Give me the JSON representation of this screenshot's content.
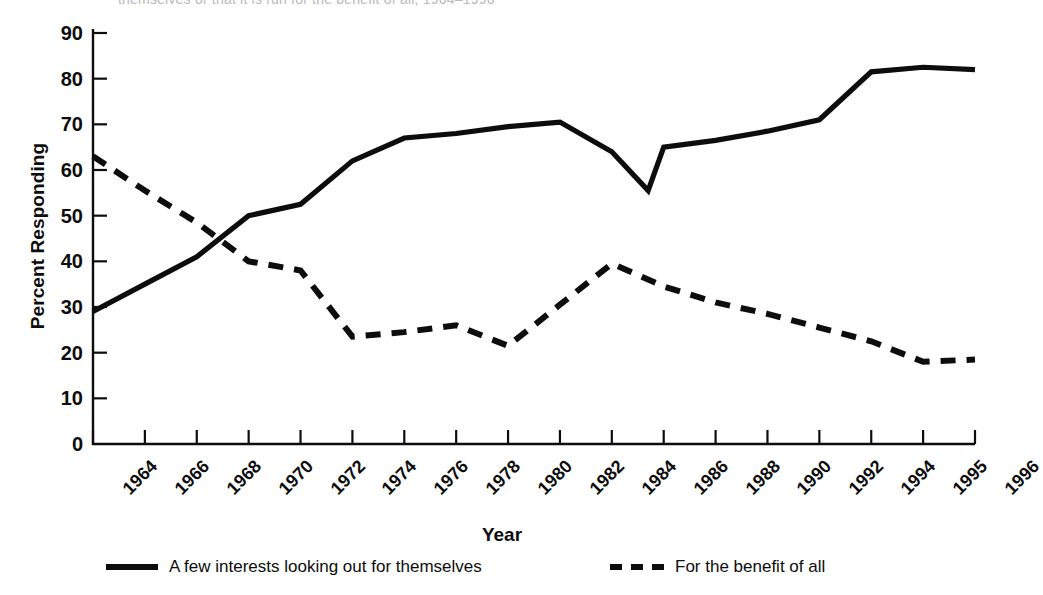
{
  "figure": {
    "clipped_title_fragment": "themselves or that it is run for the benefit of all, 1964–1996",
    "background_color": "#ffffff",
    "ink_color": "#0d0d0d"
  },
  "legend": {
    "position": "bottom",
    "items": [
      {
        "label": "A few interests looking out for themselves",
        "style": "solid",
        "swatch": "solid-line-swatch"
      },
      {
        "label": "For the benefit of all",
        "style": "dashed",
        "swatch": "dashed-line-swatch"
      }
    ]
  },
  "chart_data": {
    "type": "line",
    "title": "",
    "xlabel": "Year",
    "ylabel": "Percent Responding",
    "ylim": [
      0,
      90
    ],
    "ytick_step": 10,
    "yticks": [
      0,
      10,
      20,
      30,
      40,
      50,
      60,
      70,
      80,
      90
    ],
    "grid": false,
    "categories": [
      "1964",
      "1966",
      "1968",
      "1970",
      "1972",
      "1974",
      "1976",
      "1978",
      "1980",
      "1982",
      "1984",
      "1986",
      "1988",
      "1990",
      "1992",
      "1994",
      "1995",
      "1996"
    ],
    "x_extra_vertices": {
      "solid_dip_between_1984_and_1986": {
        "at_category_index": 10.7,
        "value": 55.5,
        "approx_year": "1985"
      }
    },
    "series": [
      {
        "name": "A few interests looking out for themselves",
        "style": "solid",
        "color": "#0d0d0d",
        "values": [
          29,
          35,
          41,
          50,
          52.5,
          62,
          67,
          68,
          69.5,
          70.5,
          64,
          65,
          66.5,
          68.5,
          71,
          81.5,
          82.5,
          82
        ]
      },
      {
        "name": "For the benefit of all",
        "style": "dashed",
        "color": "#0d0d0d",
        "values": [
          63,
          55.5,
          48.5,
          40,
          38,
          23.5,
          24.5,
          26,
          21.5,
          30.5,
          39.5,
          34.5,
          31,
          28.5,
          25.5,
          22.5,
          18,
          18.5
        ]
      }
    ]
  }
}
